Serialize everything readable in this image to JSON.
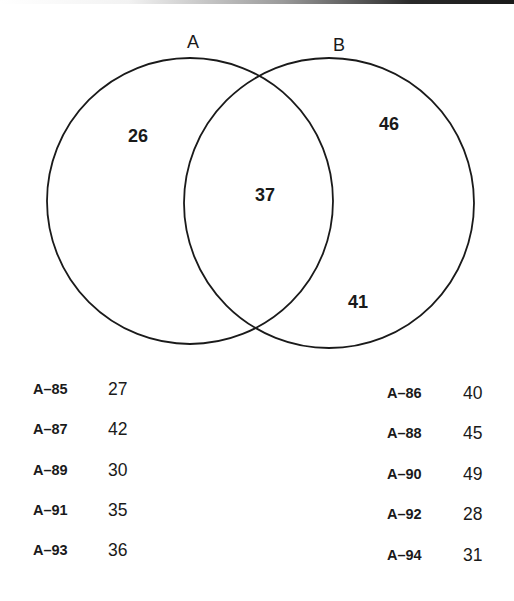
{
  "venn": {
    "sets": [
      {
        "label": "A",
        "only_value": "26"
      },
      {
        "label": "B",
        "only_value": "46"
      }
    ],
    "intersection_value": "37",
    "outside_b_lower_value": "41",
    "stroke_color": "#1a1a1a"
  },
  "table": {
    "left_column": [
      {
        "id": "A–85",
        "value": "27"
      },
      {
        "id": "A–87",
        "value": "42"
      },
      {
        "id": "A–89",
        "value": "30"
      },
      {
        "id": "A–91",
        "value": "35"
      },
      {
        "id": "A–93",
        "value": "36"
      }
    ],
    "right_column": [
      {
        "id": "A–86",
        "value": "40"
      },
      {
        "id": "A–88",
        "value": "45"
      },
      {
        "id": "A–90",
        "value": "49"
      },
      {
        "id": "A–92",
        "value": "28"
      },
      {
        "id": "A–94",
        "value": "31"
      }
    ]
  }
}
